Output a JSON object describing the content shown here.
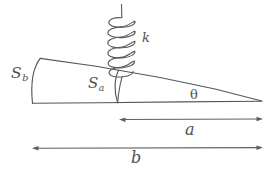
{
  "diagram": {
    "background_color": "#ffffff",
    "stroke_color": "#565656",
    "labels": {
      "s_b_main": "S",
      "s_b_sub": "b",
      "s_a_main": "S",
      "s_a_sub": "a",
      "spring_constant": "k",
      "angle": "θ",
      "dim_a": "a",
      "dim_b": "b"
    },
    "elements": {
      "wedge_name": "tapered-wedge",
      "spring_name": "coil-spring",
      "arc_sb_name": "arc-s-b",
      "arc_sa_name": "arc-s-a",
      "dimension_a_name": "dimension-line-a",
      "dimension_b_name": "dimension-line-b"
    }
  }
}
